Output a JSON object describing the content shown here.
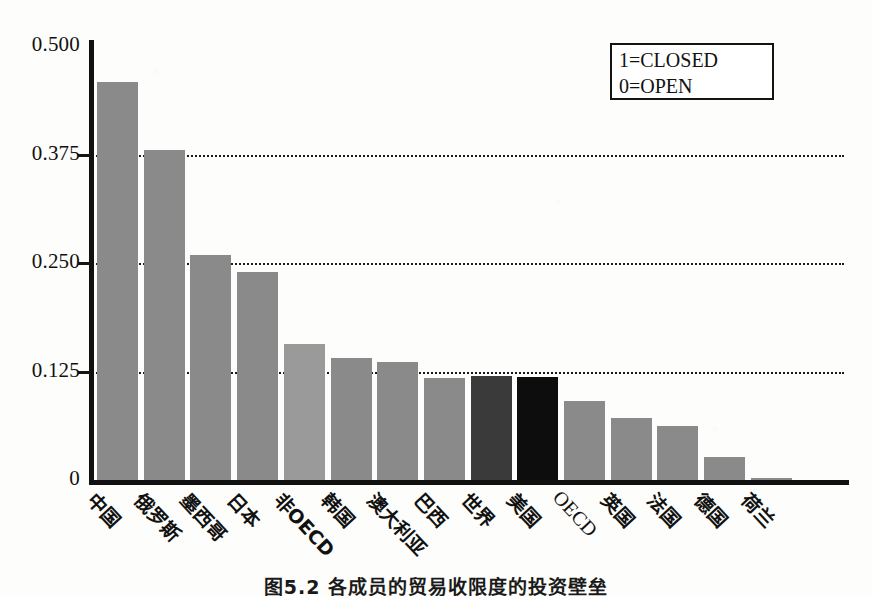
{
  "chart_data": {
    "type": "bar",
    "title": "",
    "xlabel": "",
    "ylabel": "",
    "ylim": [
      0,
      0.5
    ],
    "ytick_labels": [
      "0.500",
      "0.375",
      "0.250",
      "0.125",
      "0"
    ],
    "ytick_values": [
      0.5,
      0.375,
      0.25,
      0.125,
      0
    ],
    "gridlines": [
      0.375,
      0.25,
      0.125
    ],
    "grid": true,
    "legend_position": "top-right",
    "legend_entries": [
      "1=CLOSED",
      "0=OPEN"
    ],
    "categories": [
      "中国",
      "俄罗斯",
      "墨西哥",
      "日本",
      "非OECD",
      "韩国",
      "澳大利亚",
      "巴西",
      "世界",
      "美国",
      "OECD",
      "英国",
      "法国",
      "德国",
      "荷兰"
    ],
    "values": [
      0.459,
      0.38,
      0.259,
      0.24,
      0.157,
      0.14,
      0.136,
      0.118,
      0.12,
      0.119,
      0.091,
      0.071,
      0.062,
      0.026,
      0.002
    ],
    "bar_shades": [
      "mid",
      "mid",
      "mid",
      "mid",
      "light",
      "mid",
      "mid",
      "mid",
      "dark",
      "black",
      "mid",
      "mid",
      "mid",
      "mid",
      "mid"
    ],
    "colors": {
      "bar_mid": "#8a8a8a",
      "bar_light": "#9a9a9a",
      "bar_dark": "#3a3a3a",
      "bar_black": "#0d0d0d",
      "axis": "#101010",
      "grid": "#1a1a1a",
      "background": "#fdfdfb"
    }
  },
  "legend": {
    "line1": "1=CLOSED",
    "line2": "0=OPEN"
  },
  "caption": {
    "text": "图5.2  各成员的贸易收限度的投资壁垒"
  }
}
